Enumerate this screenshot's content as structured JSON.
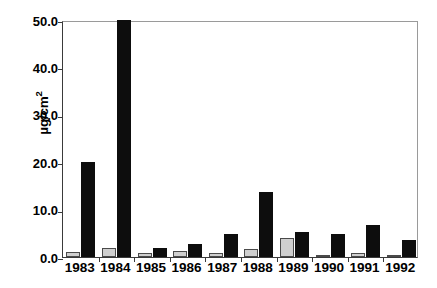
{
  "chart_data": {
    "type": "bar",
    "title": "Epilithic Chlorophyll",
    "xlabel": "",
    "ylabel": "µg/cm",
    "ylabel_sup": "2",
    "categories": [
      "1983",
      "1984",
      "1985",
      "1986",
      "1987",
      "1988",
      "1989",
      "1990",
      "1991",
      "1992"
    ],
    "series": [
      {
        "name": "Control",
        "color": "#cfcfcf",
        "values": [
          1.0,
          2.0,
          0.9,
          1.3,
          0.9,
          1.7,
          4.0,
          0.5,
          0.8,
          0.4
        ]
      },
      {
        "name": "Fertilized",
        "color": "#0d0d0d",
        "values": [
          20.0,
          50.0,
          2.0,
          2.8,
          4.8,
          13.8,
          5.2,
          4.8,
          6.8,
          3.6
        ]
      }
    ],
    "ylim": [
      0,
      50
    ],
    "yticks": [
      0.0,
      10.0,
      20.0,
      30.0,
      40.0,
      50.0
    ],
    "ytick_labels": [
      "0.0",
      "10.0",
      "20.0",
      "30.0",
      "40.0",
      "50.0"
    ],
    "grid": false,
    "legend_position": "top-right"
  }
}
